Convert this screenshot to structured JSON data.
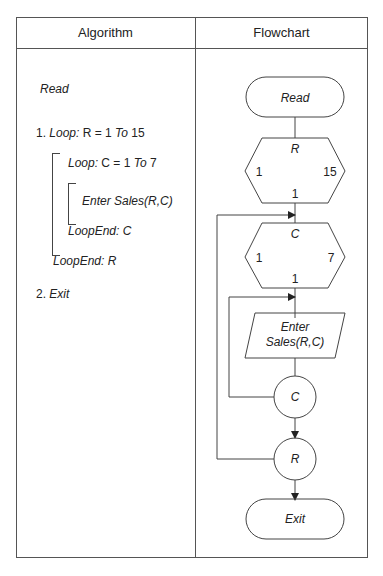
{
  "header": {
    "left": "Algorithm",
    "right": "Flowchart"
  },
  "algorithm": {
    "read": "Read",
    "step1_num": "1. ",
    "step1_loop": "Loop:",
    "step1_expr": " R = 1 ",
    "step1_to": "To",
    "step1_end": " 15",
    "inner_loop": "Loop:",
    "inner_expr": " C = 1 ",
    "inner_to": "To",
    "inner_end": " 7",
    "enter": "Enter Sales(R,C)",
    "loopend_c": "LoopEnd: C",
    "loopend_r": "LoopEnd: R",
    "exit_num": "2. ",
    "exit": "Exit"
  },
  "flowchart": {
    "read": "Read",
    "loop_r": {
      "var": "R",
      "start": "1",
      "end": "15",
      "step": "1"
    },
    "loop_c": {
      "var": "C",
      "start": "1",
      "end": "7",
      "step": "1"
    },
    "enter_line1": "Enter",
    "enter_line2": "Sales(R,C)",
    "connector_c": "C",
    "connector_r": "R",
    "exit": "Exit"
  }
}
